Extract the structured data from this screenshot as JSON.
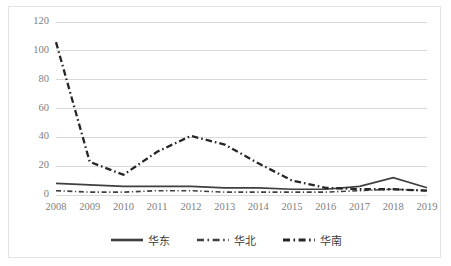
{
  "chart_data": {
    "type": "line",
    "title": "",
    "xlabel": "",
    "ylabel": "",
    "categories": [
      "2008",
      "2009",
      "2010",
      "2011",
      "2012",
      "2013",
      "2014",
      "2015",
      "2016",
      "2017",
      "2018",
      "2019"
    ],
    "x": [
      2008,
      2009,
      2010,
      2011,
      2012,
      2013,
      2014,
      2015,
      2016,
      2017,
      2018,
      2019
    ],
    "ylim": [
      0,
      120
    ],
    "yticks": [
      0,
      20,
      40,
      60,
      80,
      100,
      120
    ],
    "ytick_labels": [
      "0",
      "20",
      "40",
      "60",
      "80",
      "100",
      "120"
    ],
    "xtick_labels": [
      "2008",
      "2009",
      "2010",
      "2011",
      "2012",
      "2013",
      "2014",
      "2015",
      "2016",
      "2017",
      "2018",
      "2019"
    ],
    "grid": "horizontal",
    "legend_position": "bottom",
    "series": [
      {
        "name": "华东",
        "style": "solid",
        "color": "#3f3f3f",
        "values": [
          8,
          7,
          6,
          6,
          6,
          5,
          5,
          4,
          4,
          6,
          12,
          5
        ]
      },
      {
        "name": "华北",
        "style": "dash-dot",
        "color": "#3f3f3f",
        "values": [
          3,
          2,
          2,
          3,
          3,
          2,
          2,
          2,
          2,
          3,
          4,
          3
        ]
      },
      {
        "name": "华南",
        "style": "dash-dot-bold",
        "color": "#262626",
        "values": [
          106,
          23,
          14,
          30,
          41,
          35,
          22,
          10,
          5,
          4,
          4,
          3
        ]
      }
    ]
  },
  "axes": {
    "grid_color": "#d9d9d9",
    "tick_label_color": "#808080",
    "border_color": "#e2e2e2"
  },
  "legend": {
    "entries": [
      {
        "label": "华东",
        "style": "solid"
      },
      {
        "label": "华北",
        "style": "dash-dot"
      },
      {
        "label": "华南",
        "style": "dash-dot-bold"
      }
    ]
  }
}
